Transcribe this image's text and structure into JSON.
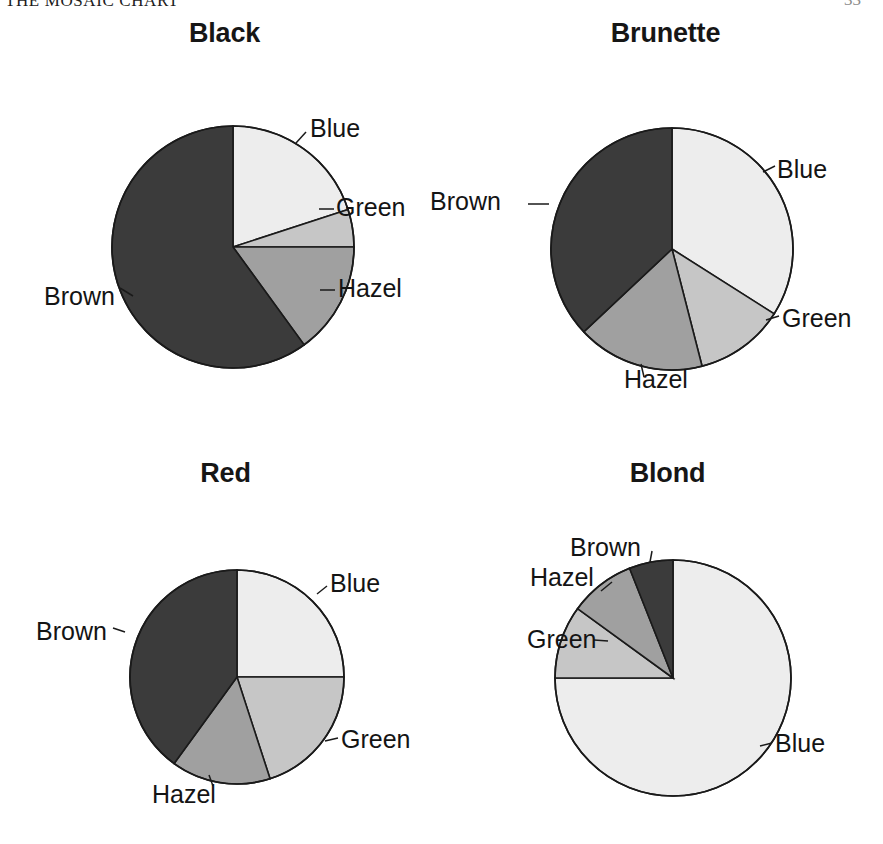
{
  "page": {
    "running_head": "THE MOSAIC CHART",
    "folio": "33",
    "background_color": "#ffffff"
  },
  "palette": {
    "blue_fill": "#ededed",
    "green_fill": "#c6c6c6",
    "hazel_fill": "#a0a0a0",
    "brown_fill": "#3b3b3b",
    "outline": "#1a1a1a",
    "text": "#141414"
  },
  "chart_data": {
    "type": "pie",
    "title": "THE MOSAIC CHART",
    "categories": [
      "Blue",
      "Green",
      "Hazel",
      "Brown"
    ],
    "slice_colors": [
      "#ededed",
      "#c6c6c6",
      "#a0a0a0",
      "#3b3b3b"
    ],
    "legend": "none (slices labelled directly with leader lines)",
    "grid": false,
    "charts": [
      {
        "title": "Black",
        "labels": [
          "Blue",
          "Green",
          "Hazel",
          "Brown"
        ],
        "values": [
          20,
          5,
          15,
          60
        ],
        "start_angle_deg": 0,
        "direction": "clockwise"
      },
      {
        "title": "Brunette",
        "labels": [
          "Blue",
          "Green",
          "Hazel",
          "Brown"
        ],
        "values": [
          34,
          12,
          17,
          37
        ],
        "start_angle_deg": 0,
        "direction": "clockwise"
      },
      {
        "title": "Red",
        "labels": [
          "Blue",
          "Green",
          "Hazel",
          "Brown"
        ],
        "values": [
          25,
          20,
          15,
          40
        ],
        "start_angle_deg": 0,
        "direction": "clockwise"
      },
      {
        "title": "Blond",
        "labels": [
          "Blue",
          "Green",
          "Hazel",
          "Brown"
        ],
        "values": [
          75,
          10,
          9,
          6
        ],
        "start_angle_deg": 0,
        "direction": "clockwise"
      }
    ]
  },
  "panels": [
    {
      "title": "Black",
      "center": {
        "x": 233,
        "y": 247
      },
      "radius": 121,
      "slices": [
        {
          "name": "Blue",
          "value": 20,
          "fill": "#ededed"
        },
        {
          "name": "Green",
          "value": 5,
          "fill": "#c6c6c6"
        },
        {
          "name": "Hazel",
          "value": 15,
          "fill": "#a0a0a0"
        },
        {
          "name": "Brown",
          "value": 60,
          "fill": "#3b3b3b"
        }
      ],
      "labels": [
        {
          "text": "Blue",
          "x": 310,
          "y": 137,
          "anchor": "start",
          "leader": [
            [
              296,
              143
            ],
            [
              306,
              132
            ]
          ]
        },
        {
          "text": "Green",
          "x": 336,
          "y": 216,
          "anchor": "start",
          "leader": [
            [
              319,
              209
            ],
            [
              334,
              209
            ]
          ]
        },
        {
          "text": "Hazel",
          "x": 338,
          "y": 297,
          "anchor": "start",
          "leader": [
            [
              320,
              290
            ],
            [
              335,
              290
            ]
          ]
        },
        {
          "text": "Brown",
          "x": 44,
          "y": 305,
          "anchor": "start",
          "leader": [
            [
              133,
              296
            ],
            [
              120,
              288
            ]
          ]
        }
      ]
    },
    {
      "title": "Brunette",
      "center": {
        "x": 672,
        "y": 249
      },
      "radius": 121,
      "slices": [
        {
          "name": "Blue",
          "value": 34,
          "fill": "#ededed"
        },
        {
          "name": "Green",
          "value": 12,
          "fill": "#c6c6c6"
        },
        {
          "name": "Hazel",
          "value": 17,
          "fill": "#a0a0a0"
        },
        {
          "name": "Brown",
          "value": 37,
          "fill": "#3b3b3b"
        }
      ],
      "labels": [
        {
          "text": "Blue",
          "x": 777,
          "y": 178,
          "anchor": "start",
          "leader": [
            [
              763,
              172
            ],
            [
              775,
              166
            ]
          ]
        },
        {
          "text": "Green",
          "x": 782,
          "y": 327,
          "anchor": "start",
          "leader": [
            [
              766,
              320
            ],
            [
              779,
              316
            ]
          ]
        },
        {
          "text": "Hazel",
          "x": 624,
          "y": 388,
          "anchor": "start",
          "leader": [
            [
              644,
              377
            ],
            [
              641,
              364
            ]
          ]
        },
        {
          "text": "Brown",
          "x": 430,
          "y": 210,
          "anchor": "start",
          "leader": [
            [
              528,
              204
            ],
            [
              549,
              204
            ]
          ]
        }
      ]
    },
    {
      "title": "Red",
      "center": {
        "x": 237,
        "y": 677
      },
      "radius": 107,
      "slices": [
        {
          "name": "Blue",
          "value": 25,
          "fill": "#ededed"
        },
        {
          "name": "Green",
          "value": 20,
          "fill": "#c6c6c6"
        },
        {
          "name": "Hazel",
          "value": 15,
          "fill": "#a0a0a0"
        },
        {
          "name": "Brown",
          "value": 40,
          "fill": "#3b3b3b"
        }
      ],
      "labels": [
        {
          "text": "Blue",
          "x": 330,
          "y": 592,
          "anchor": "start",
          "leader": [
            [
              317,
              594
            ],
            [
              327,
              586
            ]
          ]
        },
        {
          "text": "Green",
          "x": 341,
          "y": 748,
          "anchor": "start",
          "leader": [
            [
              325,
              741
            ],
            [
              338,
              738
            ]
          ]
        },
        {
          "text": "Hazel",
          "x": 152,
          "y": 803,
          "anchor": "start",
          "leader": [
            [
              213,
              786
            ],
            [
              209,
              775
            ]
          ]
        },
        {
          "text": "Brown",
          "x": 36,
          "y": 640,
          "anchor": "start",
          "leader": [
            [
              125,
              632
            ],
            [
              113,
              628
            ]
          ]
        }
      ]
    },
    {
      "title": "Blond",
      "center": {
        "x": 673,
        "y": 678
      },
      "radius": 118,
      "slices": [
        {
          "name": "Blue",
          "value": 75,
          "fill": "#ededed"
        },
        {
          "name": "Green",
          "value": 10,
          "fill": "#c6c6c6"
        },
        {
          "name": "Hazel",
          "value": 9,
          "fill": "#a0a0a0"
        },
        {
          "name": "Brown",
          "value": 6,
          "fill": "#3b3b3b"
        }
      ],
      "labels": [
        {
          "text": "Blue",
          "x": 775,
          "y": 752,
          "anchor": "start",
          "leader": [
            [
              760,
              746
            ],
            [
              772,
              743
            ]
          ]
        },
        {
          "text": "Green",
          "x": 527,
          "y": 648,
          "anchor": "start",
          "leader": [
            [
              608,
              641
            ],
            [
              594,
              640
            ]
          ]
        },
        {
          "text": "Hazel",
          "x": 530,
          "y": 586,
          "anchor": "start",
          "leader": [
            [
              612,
              582
            ],
            [
              601,
              591
            ]
          ]
        },
        {
          "text": "Brown",
          "x": 570,
          "y": 556,
          "anchor": "start",
          "leader": [
            [
              652,
              551
            ],
            [
              650,
              562
            ]
          ]
        }
      ]
    }
  ]
}
